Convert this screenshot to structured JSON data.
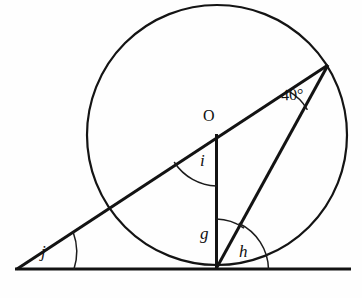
{
  "figure": {
    "type": "circle-geometry-diagram",
    "background_color": "#fefefe",
    "stroke_color": "#141414",
    "width": 362,
    "height": 298
  },
  "labels": {
    "center_point": "O",
    "angle_i": "i",
    "angle_g": "g",
    "angle_h": "h",
    "angle_j": "j",
    "angle_known": "40°"
  },
  "geometry": {
    "circle": {
      "cx": 217,
      "cy": 135,
      "r": 130
    },
    "points": {
      "center_O": {
        "x": 217,
        "y": 135
      },
      "left_vertex_j": {
        "x": 17,
        "y": 269
      },
      "tangent_point": {
        "x": 216,
        "y": 269
      },
      "upper_right_vertex": {
        "x": 328,
        "y": 65
      },
      "baseline_right_end": {
        "x": 350,
        "y": 269
      }
    },
    "segments": [
      {
        "name": "baseline",
        "from": "left_vertex_j",
        "to": "baseline_right_end"
      },
      {
        "name": "secant",
        "from": "left_vertex_j",
        "to": "upper_right_vertex"
      },
      {
        "name": "radius-vertical",
        "from": "center_O",
        "to": "tangent_point"
      },
      {
        "name": "chord",
        "from": "upper_right_vertex",
        "to": "tangent_point"
      }
    ],
    "angle_arcs": [
      {
        "name": "arc-40",
        "vertex": "upper_right_vertex",
        "label": "40°"
      },
      {
        "name": "arc-i",
        "vertex": "center_O",
        "label": "i"
      },
      {
        "name": "arc-g",
        "vertex": "tangent_point",
        "label": "g"
      },
      {
        "name": "arc-h",
        "vertex": "tangent_point",
        "label": "h"
      },
      {
        "name": "arc-j",
        "vertex": "left_vertex_j",
        "label": "j"
      }
    ]
  }
}
